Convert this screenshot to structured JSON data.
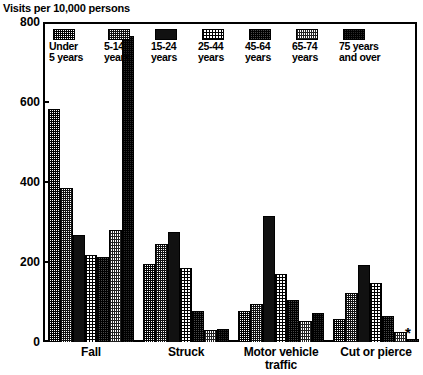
{
  "chart_data": {
    "type": "bar",
    "title": "",
    "ylabel": "Visits per 10,000 persons",
    "xlabel": "",
    "ylim": [
      0,
      800
    ],
    "yticks": [
      0,
      200,
      400,
      600,
      800
    ],
    "grid": false,
    "legend_position": "top-inside",
    "categories": [
      "Fall",
      "Struck",
      "Motor vehicle\ntraffic",
      "Cut or pierce"
    ],
    "series": [
      {
        "name": "Under\n5 years",
        "values": [
          582,
          195,
          78,
          58
        ]
      },
      {
        "name": "5-14\nyears",
        "values": [
          385,
          245,
          95,
          122
        ]
      },
      {
        "name": "15-24\nyears",
        "values": [
          268,
          275,
          315,
          193
        ]
      },
      {
        "name": "25-44\nyears",
        "values": [
          218,
          185,
          170,
          148
        ]
      },
      {
        "name": "45-64\nyears",
        "values": [
          212,
          78,
          105,
          65
        ]
      },
      {
        "name": "65-74\nyears",
        "values": [
          280,
          30,
          52,
          25
        ]
      },
      {
        "name": "75 years\nand over",
        "values": [
          765,
          32,
          72,
          8
        ]
      }
    ],
    "annotations": [
      {
        "text": "*",
        "note": "asterisk footnote marker beside last bar of Cut or pierce"
      }
    ]
  },
  "axis": {
    "y_title": "Visits per 10,000 persons",
    "y_tick_labels": [
      "800",
      "600",
      "400",
      "200",
      "0"
    ],
    "x_tick_labels": [
      "Fall",
      "Struck",
      "Motor vehicle\ntraffic",
      "Cut or pierce"
    ]
  },
  "legend": {
    "entries": [
      {
        "label": "Under\n5 years",
        "pattern": "medium-halftone"
      },
      {
        "label": "5-14\nyears",
        "pattern": "grey-halftone"
      },
      {
        "label": "15-24\nyears",
        "pattern": "solid-black"
      },
      {
        "label": "25-44\nyears",
        "pattern": "light-halftone"
      },
      {
        "label": "45-64\nyears",
        "pattern": "dark-halftone"
      },
      {
        "label": "65-74\nyears",
        "pattern": "light-grey-halftone"
      },
      {
        "label": "75 years\nand over",
        "pattern": "very-dark-halftone"
      }
    ]
  },
  "footnote": {
    "marker": "*"
  },
  "colors": {
    "axis": "#000000",
    "background": "#ffffff",
    "ink": "#000000"
  }
}
